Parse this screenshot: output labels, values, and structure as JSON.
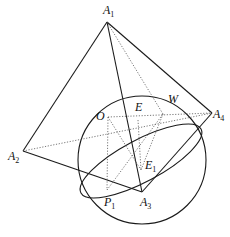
{
  "diagram": {
    "type": "geometry",
    "labels": {
      "A1": {
        "main": "A",
        "sub": "1"
      },
      "A2": {
        "main": "A",
        "sub": "2"
      },
      "A3": {
        "main": "A",
        "sub": "3"
      },
      "A4": {
        "main": "A",
        "sub": "4"
      },
      "O": {
        "main": "O",
        "sub": ""
      },
      "E": {
        "main": "E",
        "sub": ""
      },
      "W": {
        "main": "W",
        "sub": ""
      },
      "E1": {
        "main": "E",
        "sub": "1"
      },
      "P1": {
        "main": "P",
        "sub": "1"
      }
    },
    "points": {
      "A1": [
        107,
        22
      ],
      "A2": [
        23,
        151
      ],
      "A3": [
        142,
        192
      ],
      "A4": [
        212,
        113
      ],
      "O": [
        108,
        117
      ],
      "E": [
        138,
        120
      ],
      "W": [
        163,
        114
      ],
      "E1": [
        141,
        170
      ],
      "P1": [
        107,
        190
      ]
    },
    "sphere": {
      "cx": 142,
      "cy": 160,
      "r": 64
    },
    "ellipse": {
      "cx": 141,
      "cy": 161,
      "rx": 68,
      "ry": 21,
      "rotate": -28
    }
  }
}
